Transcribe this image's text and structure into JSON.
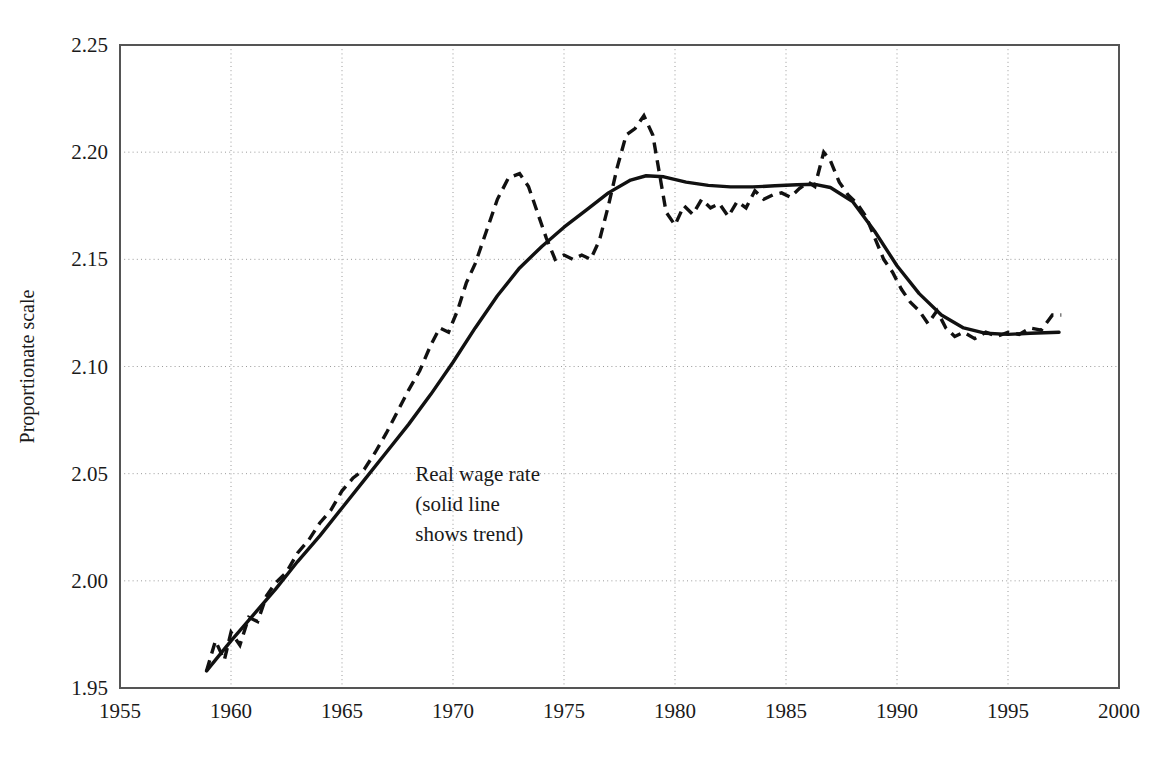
{
  "chart_data": {
    "type": "line",
    "title": "",
    "xlabel": "",
    "ylabel": "Proportionate scale",
    "xlim": [
      1955,
      2000
    ],
    "ylim": [
      1.95,
      2.25
    ],
    "xticks": [
      1955,
      1960,
      1965,
      1970,
      1975,
      1980,
      1985,
      1990,
      1995,
      2000
    ],
    "yticks": [
      1.95,
      2.0,
      2.05,
      2.1,
      2.15,
      2.2,
      2.25
    ],
    "xtick_labels": [
      "1955",
      "1960",
      "1965",
      "1970",
      "1975",
      "1980",
      "1985",
      "1990",
      "1995",
      "2000"
    ],
    "ytick_labels": [
      "1.95",
      "2.00",
      "2.05",
      "2.10",
      "2.15",
      "2.20",
      "2.25"
    ],
    "grid": true,
    "grid_style": "dotted",
    "legend": "none",
    "annotations": [
      {
        "name": "series-annotation",
        "lines": [
          "Real wage rate",
          "(solid line",
          "shows trend)"
        ],
        "x": 1968.3,
        "y": 2.0465
      }
    ],
    "series": [
      {
        "name": "Real wage rate",
        "style": "dashed",
        "color": "#111111",
        "x": [
          1958.9,
          1959.3,
          1959.7,
          1960.0,
          1960.4,
          1960.8,
          1961.2,
          1961.6,
          1962.0,
          1962.5,
          1963.0,
          1963.5,
          1964.0,
          1964.5,
          1965.0,
          1965.5,
          1966.0,
          1966.5,
          1967.0,
          1967.5,
          1968.0,
          1968.5,
          1969.0,
          1969.4,
          1969.8,
          1970.2,
          1970.6,
          1971.0,
          1971.5,
          1972.0,
          1972.5,
          1973.0,
          1973.4,
          1973.8,
          1974.2,
          1974.6,
          1975.0,
          1975.4,
          1975.8,
          1976.2,
          1976.6,
          1977.0,
          1977.4,
          1977.8,
          1978.2,
          1978.6,
          1979.0,
          1979.3,
          1979.6,
          1980.0,
          1980.4,
          1980.8,
          1981.2,
          1981.6,
          1982.0,
          1982.4,
          1982.8,
          1983.2,
          1983.6,
          1984.0,
          1984.4,
          1984.8,
          1985.2,
          1985.6,
          1986.0,
          1986.3,
          1986.7,
          1987.0,
          1987.4,
          1987.8,
          1988.2,
          1988.6,
          1989.0,
          1989.4,
          1989.8,
          1990.2,
          1990.6,
          1991.0,
          1991.4,
          1991.8,
          1992.2,
          1992.6,
          1993.0,
          1993.5,
          1994.0,
          1994.5,
          1995.0,
          1995.5,
          1996.0,
          1996.5,
          1997.0,
          1997.4
        ],
        "y": [
          1.958,
          1.972,
          1.963,
          1.976,
          1.97,
          1.983,
          1.981,
          1.993,
          1.999,
          2.004,
          2.013,
          2.019,
          2.027,
          2.033,
          2.042,
          2.048,
          2.052,
          2.06,
          2.069,
          2.079,
          2.089,
          2.098,
          2.11,
          2.118,
          2.116,
          2.126,
          2.139,
          2.148,
          2.163,
          2.178,
          2.188,
          2.19,
          2.184,
          2.172,
          2.16,
          2.15,
          2.152,
          2.15,
          2.152,
          2.15,
          2.159,
          2.175,
          2.193,
          2.208,
          2.211,
          2.217,
          2.208,
          2.19,
          2.172,
          2.166,
          2.175,
          2.171,
          2.178,
          2.174,
          2.176,
          2.17,
          2.177,
          2.174,
          2.182,
          2.178,
          2.18,
          2.181,
          2.179,
          2.183,
          2.186,
          2.184,
          2.2,
          2.196,
          2.186,
          2.18,
          2.176,
          2.17,
          2.16,
          2.15,
          2.144,
          2.136,
          2.13,
          2.126,
          2.12,
          2.126,
          2.118,
          2.114,
          2.116,
          2.113,
          2.116,
          2.114,
          2.116,
          2.115,
          2.118,
          2.117,
          2.124,
          2.124
        ]
      },
      {
        "name": "Trend",
        "style": "solid",
        "color": "#111111",
        "x": [
          1958.9,
          1960.0,
          1961.0,
          1962.0,
          1963.0,
          1964.0,
          1965.0,
          1966.0,
          1967.0,
          1968.0,
          1969.0,
          1970.0,
          1971.0,
          1972.0,
          1973.0,
          1974.0,
          1975.0,
          1976.0,
          1977.0,
          1978.0,
          1978.7,
          1979.5,
          1980.5,
          1981.5,
          1982.5,
          1983.5,
          1984.5,
          1985.5,
          1986.3,
          1987.0,
          1988.0,
          1989.0,
          1990.0,
          1991.0,
          1992.0,
          1993.0,
          1994.0,
          1995.0,
          1996.0,
          1997.3
        ],
        "y": [
          1.958,
          1.972,
          1.984,
          1.996,
          2.009,
          2.021,
          2.034,
          2.047,
          2.06,
          2.073,
          2.087,
          2.102,
          2.118,
          2.133,
          2.146,
          2.156,
          2.165,
          2.173,
          2.181,
          2.187,
          2.189,
          2.1885,
          2.186,
          2.1845,
          2.1838,
          2.1838,
          2.1843,
          2.1848,
          2.185,
          2.1835,
          2.177,
          2.163,
          2.147,
          2.134,
          2.124,
          2.118,
          2.1155,
          2.115,
          2.1155,
          2.116
        ]
      }
    ]
  },
  "plot": {
    "left_px": 120,
    "right_px": 1119,
    "top_px": 45,
    "bottom_px": 688
  }
}
